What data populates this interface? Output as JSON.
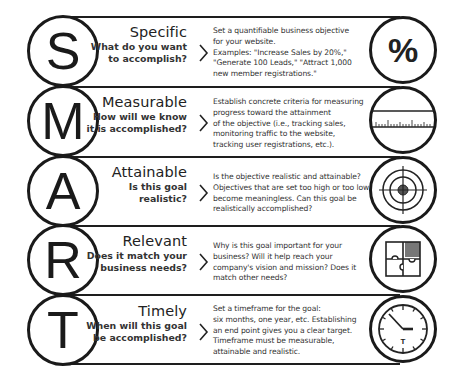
{
  "rows": [
    {
      "letter": "S",
      "heading": "Specific",
      "question_line1": "What do you want",
      "question_line2": "to accomplish?",
      "description": [
        "Set a quantifiable business objective",
        "for your website.",
        "Examples: \"Increase Sales by 20%,\"",
        "\"Generate 100 Leads,\" \"Attract 1,000",
        "new member registrations.\""
      ],
      "icon": "percent-icon",
      "icon_text": "%"
    },
    {
      "letter": "M",
      "heading": "Measurable",
      "question_line1": "How will we know",
      "question_line2": "it is accomplished?",
      "description": [
        "Establish concrete criteria for measuring",
        "progress toward the attainment",
        "of the objective (i.e., tracking sales,",
        "monitoring traffic to the website,",
        "tracking user registrations, etc.)."
      ],
      "icon": "ruler-icon"
    },
    {
      "letter": "A",
      "heading": "Attainable",
      "question_line1": "Is this goal",
      "question_line2": "realistic?",
      "description": [
        "Is the objective realistic and attainable?",
        "Objectives that are set too high or too low",
        "become meaningless. Can this goal be",
        "realistically accomplished?"
      ],
      "icon": "target-icon"
    },
    {
      "letter": "R",
      "heading": "Relevant",
      "question_line1": "Does it  match your",
      "question_line2": "business needs?",
      "description": [
        "Why is this goal important for your",
        "business? Will it help reach your",
        "company's vision and mission? Does it",
        "match other needs?"
      ],
      "icon": "puzzle-icon"
    },
    {
      "letter": "T",
      "heading": "Timely",
      "question_line1": "When will this goal",
      "question_line2": "be accomplished?",
      "description": [
        "Set a timeframe for the goal:",
        "six months, one year, etc. Establishing",
        "an end point gives you a clear target.",
        "Timeframe must be measurable,",
        "attainable and realistic."
      ],
      "icon": "clock-icon",
      "icon_text": "T"
    }
  ]
}
